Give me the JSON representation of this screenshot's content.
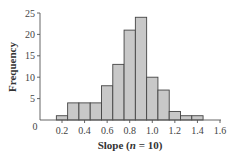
{
  "chart_data": {
    "type": "bar",
    "title": "",
    "xlabel": "Slope (n = 10)",
    "xlabel_parts": {
      "prefix": "Slope (",
      "italic": "n",
      "suffix": " = 10)"
    },
    "ylabel": "Frequency",
    "categories": [
      "0.2",
      "0.3",
      "0.4",
      "0.5",
      "0.6",
      "0.7",
      "0.8",
      "0.9",
      "1.0",
      "1.1",
      "1.2",
      "1.3",
      "1.4"
    ],
    "bin_centers": [
      0.2,
      0.3,
      0.4,
      0.5,
      0.6,
      0.7,
      0.8,
      0.9,
      1.0,
      1.1,
      1.2,
      1.3,
      1.4
    ],
    "bin_width": 0.1,
    "values": [
      1,
      4,
      4,
      4,
      8,
      13,
      21,
      24,
      10,
      7,
      2,
      1,
      1
    ],
    "xlim": [
      0.0,
      1.6
    ],
    "ylim": [
      0,
      25
    ],
    "x_ticks": [
      "0.2",
      "0.4",
      "0.6",
      "0.8",
      "1.0",
      "1.2",
      "1.4",
      "1.6"
    ],
    "y_ticks": [
      "0",
      "5",
      "10",
      "15",
      "20",
      "25"
    ],
    "grid": false,
    "legend": null,
    "colors": {
      "bar_fill": "#c8c8c8",
      "bar_edge": "#444444"
    }
  }
}
